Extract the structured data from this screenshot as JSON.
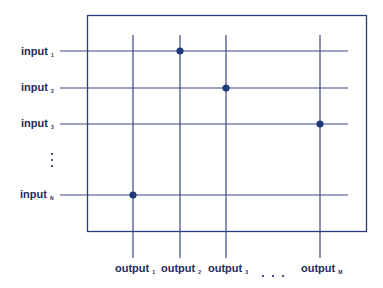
{
  "diagram": {
    "type": "crossbar-switch",
    "colors": {
      "line": "#2b3a78",
      "box": "#2b3a78",
      "dot": "#1e3a7a",
      "text": "#1f2a5c"
    },
    "inputs": [
      {
        "label": "input",
        "subscript": "1"
      },
      {
        "label": "input",
        "subscript": "2"
      },
      {
        "label": "input",
        "subscript": "3"
      },
      {
        "label": "input",
        "subscript": "N"
      }
    ],
    "input_ellipsis": "⋮",
    "outputs": [
      {
        "label": "output",
        "subscript": "1"
      },
      {
        "label": "output",
        "subscript": "2"
      },
      {
        "label": "output",
        "subscript": "3"
      },
      {
        "label": "output",
        "subscript": "M"
      }
    ],
    "output_ellipsis": ". . .",
    "connections": [
      {
        "input": "1",
        "output": "2"
      },
      {
        "input": "2",
        "output": "3"
      },
      {
        "input": "3",
        "output": "M"
      },
      {
        "input": "N",
        "output": "1"
      }
    ]
  }
}
